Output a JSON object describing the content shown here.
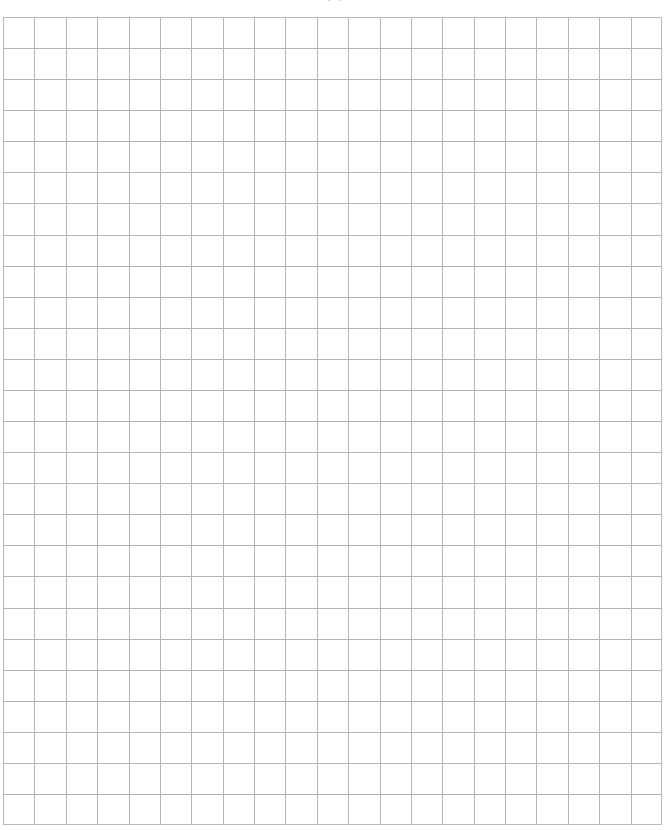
{
  "document": {
    "type": "graph-paper",
    "title": "Blank graph paper sheet",
    "background_color": "#ffffff",
    "header_partial_text": "y g"
  },
  "grid": {
    "label": "graph-paper-grid",
    "origin_x": 3,
    "origin_y": 17,
    "width": 659,
    "height": 808,
    "columns": 21,
    "rows": 26,
    "cell_width": 31.38,
    "cell_height": 31.08,
    "line_color": "#b4b4b4",
    "border_color": "#b8b8b8",
    "line_width": 1,
    "grid_visible": true,
    "content": "none"
  },
  "page": {
    "width": 670,
    "height": 830
  }
}
